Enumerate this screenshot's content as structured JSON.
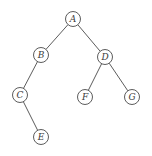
{
  "diagram": {
    "type": "binary-tree",
    "colors": {
      "stroke": "#4a4a4a",
      "text": "#3a3a3a",
      "background": "#ffffff"
    },
    "node_radius": 7.5,
    "nodes": [
      {
        "id": "A",
        "label": "A",
        "x": 73,
        "y": 19
      },
      {
        "id": "B",
        "label": "B",
        "x": 41,
        "y": 55
      },
      {
        "id": "D",
        "label": "D",
        "x": 105,
        "y": 57
      },
      {
        "id": "C",
        "label": "C",
        "x": 20,
        "y": 95
      },
      {
        "id": "F",
        "label": "F",
        "x": 85,
        "y": 97
      },
      {
        "id": "G",
        "label": "G",
        "x": 132,
        "y": 97
      },
      {
        "id": "E",
        "label": "E",
        "x": 41,
        "y": 137
      }
    ],
    "edges": [
      {
        "from": "A",
        "to": "B"
      },
      {
        "from": "A",
        "to": "D"
      },
      {
        "from": "B",
        "to": "C"
      },
      {
        "from": "C",
        "to": "E"
      },
      {
        "from": "D",
        "to": "F"
      },
      {
        "from": "D",
        "to": "G"
      }
    ]
  }
}
